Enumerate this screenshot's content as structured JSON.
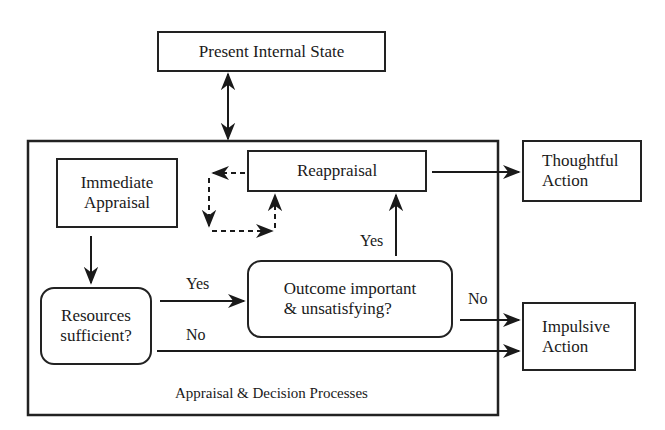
{
  "diagram": {
    "nodes": {
      "present_state": "Present Internal State",
      "container_label": "Appraisal & Decision Processes",
      "immediate": "Immediate\nAppraisal",
      "reappraisal": "Reappraisal",
      "resources": "Resources\nsufficient?",
      "outcome": "Outcome important\n& unsatisfying?",
      "thoughtful": "Thoughtful\nAction",
      "impulsive": "Impulsive\nAction"
    },
    "edge_labels": {
      "resources_yes": "Yes",
      "resources_no": "No",
      "outcome_yes": "Yes",
      "outcome_no": "No"
    },
    "edges": [
      {
        "from": "present_state",
        "to": "container",
        "type": "bidirectional"
      },
      {
        "from": "immediate",
        "to": "resources"
      },
      {
        "from": "resources",
        "to": "outcome",
        "label": "Yes"
      },
      {
        "from": "resources",
        "to": "impulsive",
        "label": "No"
      },
      {
        "from": "outcome",
        "to": "reappraisal",
        "label": "Yes"
      },
      {
        "from": "outcome",
        "to": "impulsive",
        "label": "No"
      },
      {
        "from": "reappraisal",
        "to": "thoughtful"
      },
      {
        "from": "reappraisal",
        "to": "reappraisal",
        "type": "dashed-loop"
      }
    ]
  }
}
